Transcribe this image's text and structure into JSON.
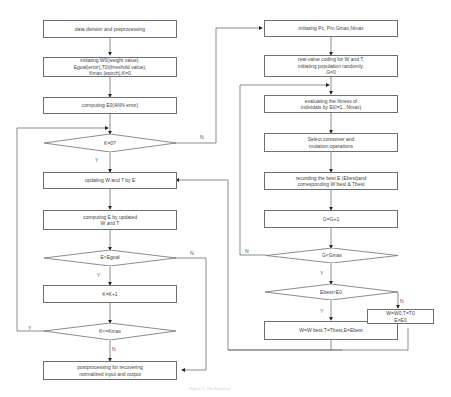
{
  "left_flow": {
    "data_div": "data division and preprocessing",
    "init": "initiating W0(weight value),\nEgoal(error),T0(threshold value),\nKmax (epoch),K=0",
    "compute_e0": "computing E0(ANN error)",
    "dec_k0": "K=0?",
    "update_wt": "updating W and T by E",
    "compute_e": "computing E by updated\nW and T",
    "dec_egoal": "E<Egoal",
    "k_inc": "K=K+1",
    "dec_kmax": "K<=Kmax",
    "post": "postprocessing for recovering\nnormalized input and output"
  },
  "right_flow": {
    "init_ga": "initiating  Pc, Pm,Gmax,Nmax",
    "coding": "real-value coding for W and T,\ninitiating population randomly,\nG=0",
    "fitness": "evaluating the fitness of\nindividals by Ei(i=1...Nmax)",
    "select": "Select,corssover and\nmutation operations",
    "record": "recording the best E (Ebest)and\ncorresponding W best & Tbest",
    "g_inc": "G=G+1",
    "dec_gmax": "G<Gmax",
    "dec_ebest": "Ebest<E0",
    "assign_best": "W=W best,T=Tbest,E=Ebest",
    "assign_zero": "W=W0,T=T0\nE=E0"
  },
  "branch_labels": {
    "yes": "Y",
    "no": "N"
  },
  "caption": "Figure 1. The flowchart"
}
